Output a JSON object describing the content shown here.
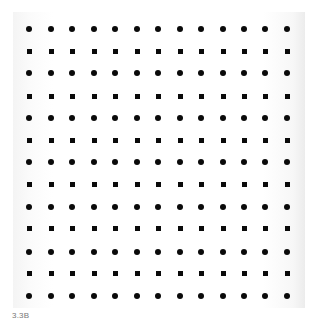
{
  "figure": {
    "caption": "3.3B",
    "grid": {
      "columns": 13,
      "rows": 13,
      "column_x": [
        29,
        51,
        72,
        94,
        115,
        137,
        158,
        180,
        201,
        223,
        244,
        265,
        287
      ],
      "row_y": [
        29,
        51,
        73,
        96,
        118,
        140,
        162,
        184,
        207,
        228,
        252,
        273,
        296
      ],
      "row_shapes": [
        "dot",
        "square",
        "dot",
        "square",
        "dot",
        "square",
        "dot",
        "square",
        "dot",
        "square",
        "dot",
        "square",
        "dot"
      ],
      "mark_color": "#0a0a0a"
    }
  }
}
